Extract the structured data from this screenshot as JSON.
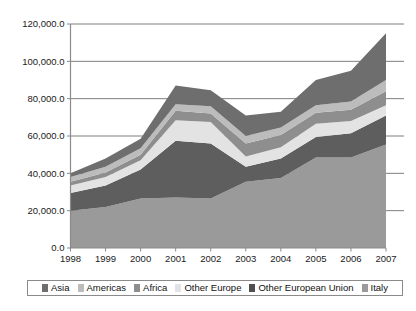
{
  "title": "",
  "chart_data": {
    "type": "area",
    "title": "",
    "subtitle": "",
    "xlabel": "",
    "ylabel": "",
    "stacked": true,
    "grid": true,
    "legend_position": "bottom",
    "categories": [
      "1998",
      "1999",
      "2000",
      "2001",
      "2002",
      "2003",
      "2004",
      "2005",
      "2006",
      "2007"
    ],
    "x": [
      1998,
      1999,
      2000,
      2001,
      2002,
      2003,
      2004,
      2005,
      2006,
      2007
    ],
    "ylim": [
      0,
      120000
    ],
    "yticks": [
      0,
      20000,
      40000,
      60000,
      80000,
      100000,
      120000
    ],
    "ytick_labels": [
      "0.0",
      "20,000.0",
      "40,000.0",
      "60,000.0",
      "80,000.0",
      "100,000.0",
      "120,000.0"
    ],
    "series": [
      {
        "name": "Italy",
        "color": "#9a9a9a",
        "values": [
          20000,
          22000,
          26500,
          27000,
          26500,
          35500,
          37500,
          48500,
          48500,
          55500
        ]
      },
      {
        "name": "Other European Union",
        "color": "#5e5e5e",
        "values": [
          9500,
          11500,
          15500,
          30500,
          29500,
          8000,
          10500,
          11000,
          13000,
          15500
        ]
      },
      {
        "name": "Other Europe",
        "color": "#e3e3e3",
        "values": [
          4000,
          4500,
          5000,
          11000,
          11500,
          5500,
          6000,
          7000,
          6500,
          5500
        ]
      },
      {
        "name": "Africa",
        "color": "#8e8e8e",
        "values": [
          2000,
          2500,
          3000,
          5000,
          4500,
          7000,
          6500,
          6000,
          6000,
          7500
        ]
      },
      {
        "name": "Americas",
        "color": "#bcbcbc",
        "values": [
          2500,
          3000,
          3500,
          3500,
          4000,
          4000,
          4000,
          4000,
          4500,
          6000
        ]
      },
      {
        "name": "Asia",
        "color": "#6e6e6e",
        "values": [
          2000,
          4500,
          5000,
          10000,
          8500,
          11000,
          8500,
          13500,
          16500,
          25000
        ]
      }
    ],
    "totals": [
      40000,
      48000,
      58500,
      87000,
      84500,
      71000,
      73000,
      90000,
      95000,
      115000
    ]
  },
  "legend": {
    "items": [
      {
        "label": "Asia",
        "color": "#6e6e6e"
      },
      {
        "label": "Americas",
        "color": "#bcbcbc"
      },
      {
        "label": "Africa",
        "color": "#8e8e8e"
      },
      {
        "label": "Other Europe",
        "color": "#e3e3e3"
      },
      {
        "label": "Other European Union",
        "color": "#4f4f4f"
      },
      {
        "label": "Italy",
        "color": "#9a9a9a"
      }
    ]
  },
  "axes": {
    "y_tick_labels": [
      "120,000.0",
      "100,000.0",
      "80,000.0",
      "60,000.0",
      "40,000.0",
      "20,000.0",
      "0.0"
    ],
    "x_tick_labels": [
      "1998",
      "1999",
      "2000",
      "2001",
      "2002",
      "2003",
      "2004",
      "2005",
      "2006",
      "2007"
    ]
  },
  "colors": {
    "axis": "#8a8a8a",
    "gridline": "#6f6f6f",
    "text": "#111111",
    "background": "#ffffff"
  }
}
